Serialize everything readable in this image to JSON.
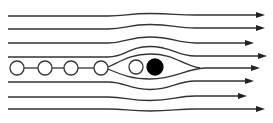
{
  "diagram": {
    "title": "",
    "colors": {
      "background": "#ffffff",
      "line": "#333333",
      "arrow": "#222222",
      "open_circle_fill": "#ffffff",
      "filled_circle": "#000000"
    },
    "streamlines": [
      {
        "id": 1,
        "y_left": 16,
        "y_right": 15,
        "bulge": -2,
        "arrow_x": 265
      },
      {
        "id": 2,
        "y_left": 29,
        "y_right": 28,
        "bulge": -4,
        "arrow_x": 265
      },
      {
        "id": 3,
        "y_left": 43,
        "y_right": 43,
        "bulge": -6,
        "arrow_x": 254
      },
      {
        "id": 4,
        "y_left": 57,
        "y_right": 56,
        "bulge": -10,
        "arrow_x": 267
      },
      {
        "id": 5,
        "y_left": 82,
        "y_right": 81,
        "bulge": 8,
        "arrow_x": 254
      },
      {
        "id": 6,
        "y_left": 97,
        "y_right": 96,
        "bulge": 4,
        "arrow_x": 247
      },
      {
        "id": 7,
        "y_left": 109,
        "y_right": 109,
        "bulge": 2,
        "arrow_x": 265
      }
    ],
    "center_streamline": {
      "y": 68,
      "arrow_x": 260
    },
    "particles": [
      {
        "type": "open",
        "cx": 17,
        "cy": 68,
        "r": 7
      },
      {
        "type": "open",
        "cx": 45,
        "cy": 68,
        "r": 7
      },
      {
        "type": "open",
        "cx": 71,
        "cy": 68,
        "r": 7
      },
      {
        "type": "open",
        "cx": 101,
        "cy": 68,
        "r": 7
      },
      {
        "type": "open",
        "cx": 136,
        "cy": 67,
        "r": 7
      },
      {
        "type": "filled",
        "cx": 155,
        "cy": 67,
        "r": 8
      }
    ]
  }
}
